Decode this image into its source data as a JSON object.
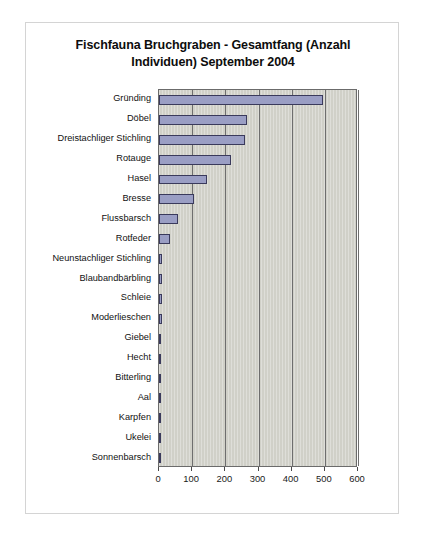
{
  "chart_data": {
    "type": "bar",
    "orientation": "horizontal",
    "title": "Fischfauna Bruchgraben - Gesamtfang (Anzahl Individuen) September 2004",
    "title_line1": "Fischfauna Bruchgraben - Gesamtfang (Anzahl",
    "title_line2": "Individuen) September 2004",
    "xlabel": "",
    "ylabel": "",
    "categories": [
      "Gründing",
      "Döbel",
      "Dreistachliger Stichling",
      "Rotauge",
      "Hasel",
      "Bresse",
      "Flussbarsch",
      "Rotfeder",
      "Neunstachliger Stichling",
      "Blaubandbärbling",
      "Schleie",
      "Moderlieschen",
      "Giebel",
      "Hecht",
      "Bitterling",
      "Aal",
      "Karpfen",
      "Ukelei",
      "Sonnenbarsch"
    ],
    "values": [
      493,
      265,
      258,
      218,
      146,
      105,
      58,
      33,
      9,
      9,
      8,
      8,
      7,
      6,
      4,
      4,
      2,
      2,
      2
    ],
    "xlim": [
      0,
      600
    ],
    "xticks": [
      0,
      100,
      200,
      300,
      400,
      500,
      600
    ],
    "xtick_labels": [
      "0",
      "100",
      "200",
      "300",
      "400",
      "500",
      "600"
    ],
    "grid": true,
    "grid_axis": "x",
    "legend": false,
    "series_color": "#9a9ec4",
    "series_border_color": "#3a3a5c",
    "plot_background": "#d0d0c8"
  }
}
